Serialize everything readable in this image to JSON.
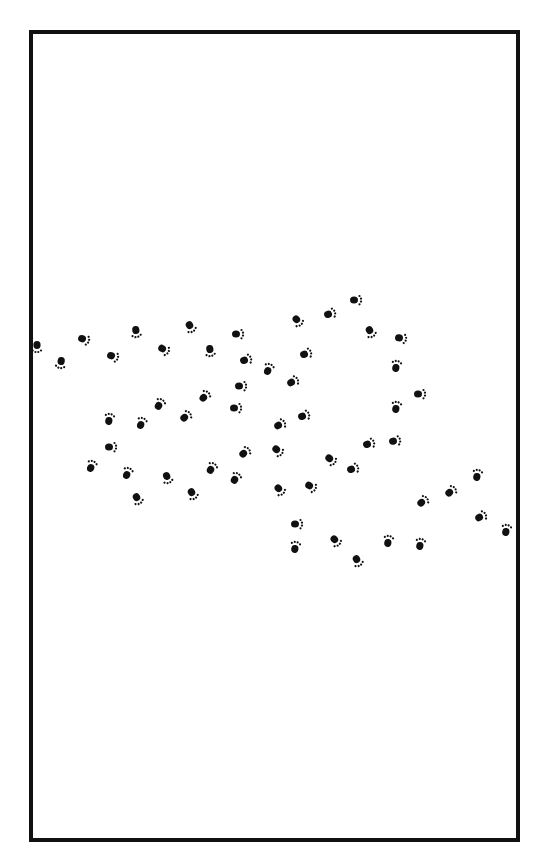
{
  "frame": {
    "border_color": "#111111",
    "background": "#ffffff"
  },
  "paw_color": "#111111",
  "paws": [
    {
      "x": 37,
      "y": 346,
      "r": 90
    },
    {
      "x": 61,
      "y": 362,
      "r": 100
    },
    {
      "x": 83,
      "y": 339,
      "r": 20
    },
    {
      "x": 112,
      "y": 356,
      "r": 20
    },
    {
      "x": 136,
      "y": 331,
      "r": 80
    },
    {
      "x": 163,
      "y": 349,
      "r": 30
    },
    {
      "x": 190,
      "y": 326,
      "r": 60
    },
    {
      "x": 210,
      "y": 350,
      "r": 80
    },
    {
      "x": 237,
      "y": 334,
      "r": 0
    },
    {
      "x": 245,
      "y": 360,
      "r": -20
    },
    {
      "x": 268,
      "y": 370,
      "r": -70
    },
    {
      "x": 297,
      "y": 320,
      "r": 50
    },
    {
      "x": 305,
      "y": 354,
      "r": -20
    },
    {
      "x": 292,
      "y": 382,
      "r": -30
    },
    {
      "x": 329,
      "y": 314,
      "r": -20
    },
    {
      "x": 355,
      "y": 300,
      "r": 0
    },
    {
      "x": 370,
      "y": 331,
      "r": 60
    },
    {
      "x": 400,
      "y": 338,
      "r": 10
    },
    {
      "x": 396,
      "y": 367,
      "r": -80
    },
    {
      "x": 419,
      "y": 394,
      "r": 0
    },
    {
      "x": 396,
      "y": 408,
      "r": -80
    },
    {
      "x": 394,
      "y": 441,
      "r": -10
    },
    {
      "x": 368,
      "y": 444,
      "r": -20
    },
    {
      "x": 352,
      "y": 469,
      "r": -20
    },
    {
      "x": 330,
      "y": 459,
      "r": 40
    },
    {
      "x": 310,
      "y": 486,
      "r": 30
    },
    {
      "x": 279,
      "y": 489,
      "r": 50
    },
    {
      "x": 277,
      "y": 450,
      "r": 40
    },
    {
      "x": 244,
      "y": 453,
      "r": -40
    },
    {
      "x": 240,
      "y": 386,
      "r": 0
    },
    {
      "x": 235,
      "y": 408,
      "r": 0
    },
    {
      "x": 279,
      "y": 425,
      "r": -30
    },
    {
      "x": 303,
      "y": 416,
      "r": -20
    },
    {
      "x": 204,
      "y": 397,
      "r": -50
    },
    {
      "x": 185,
      "y": 417,
      "r": -40
    },
    {
      "x": 159,
      "y": 405,
      "r": -60
    },
    {
      "x": 141,
      "y": 424,
      "r": -70
    },
    {
      "x": 109,
      "y": 420,
      "r": -80
    },
    {
      "x": 110,
      "y": 447,
      "r": 0
    },
    {
      "x": 91,
      "y": 467,
      "r": -70
    },
    {
      "x": 127,
      "y": 474,
      "r": -70
    },
    {
      "x": 137,
      "y": 498,
      "r": 60
    },
    {
      "x": 167,
      "y": 477,
      "r": 70
    },
    {
      "x": 192,
      "y": 493,
      "r": 60
    },
    {
      "x": 211,
      "y": 469,
      "r": -60
    },
    {
      "x": 235,
      "y": 479,
      "r": -60
    },
    {
      "x": 296,
      "y": 524,
      "r": 0
    },
    {
      "x": 295,
      "y": 548,
      "r": -80
    },
    {
      "x": 335,
      "y": 540,
      "r": 50
    },
    {
      "x": 357,
      "y": 560,
      "r": 60
    },
    {
      "x": 388,
      "y": 542,
      "r": -80
    },
    {
      "x": 420,
      "y": 545,
      "r": -80
    },
    {
      "x": 422,
      "y": 502,
      "r": -40
    },
    {
      "x": 450,
      "y": 492,
      "r": -40
    },
    {
      "x": 477,
      "y": 476,
      "r": -80
    },
    {
      "x": 480,
      "y": 517,
      "r": -30
    },
    {
      "x": 506,
      "y": 531,
      "r": -80
    }
  ]
}
